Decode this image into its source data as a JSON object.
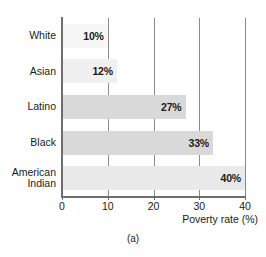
{
  "chart_data": {
    "type": "bar",
    "orientation": "horizontal",
    "title": "",
    "subtitle": "",
    "xlabel": "Poverty rate (%)",
    "ylabel": "",
    "categories": [
      "White",
      "Asian",
      "Latino",
      "Black",
      "American\nIndian"
    ],
    "values": [
      10,
      12,
      27,
      33,
      40
    ],
    "data_labels": [
      "10%",
      "12%",
      "27%",
      "33%",
      "40%"
    ],
    "xlim": [
      0,
      40
    ],
    "xticks": [
      0,
      10,
      20,
      30,
      40
    ],
    "xtick_labels": [
      "0",
      "10",
      "20",
      "30",
      "40"
    ],
    "grid": "vertical",
    "legend": "none",
    "bar_colors": [
      "#f7f7f7",
      "#f0f0f0",
      "#d9d9d9",
      "#d9d9d9",
      "#e9e9e9"
    ],
    "axis_color": "#6e6e6e",
    "gridline_color": "#8a8a8a",
    "text_color": "#1b1b1b"
  },
  "caption": "(a)"
}
